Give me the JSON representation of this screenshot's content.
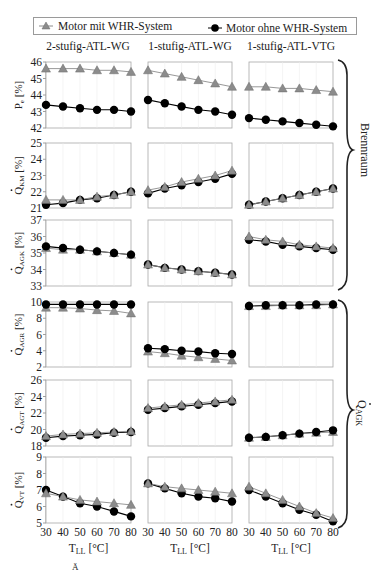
{
  "chart_data": {
    "type": "line",
    "legend": {
      "position": "top",
      "entries": [
        {
          "name": "Motor mit WHR-System",
          "marker": "triangle",
          "color": "#8c8c8c"
        },
        {
          "name": "Motor ohne WHR-System",
          "marker": "circle",
          "color": "#000000"
        }
      ]
    },
    "columns": [
      "2-stufig-ATL-WG",
      "1-stufig-ATL-WG",
      "1-stufig-ATL-VTG"
    ],
    "x": [
      30,
      40,
      50,
      60,
      70,
      80
    ],
    "xlabel": "T_LL [°C]",
    "xticks": [
      "30",
      "40",
      "50",
      "60",
      "70",
      "80"
    ],
    "grid": "vertical light",
    "groups": [
      {
        "label": "Brennraum",
        "rows": [
          0,
          1,
          2
        ]
      },
      {
        "label": "Q̇AGK",
        "rows": [
          3,
          4,
          5
        ]
      }
    ],
    "rows": [
      {
        "ylabel_main": "P",
        "ylabel_sub": "e",
        "ylabel_dot": false,
        "ylabel_unit": "[%]",
        "ylim": [
          42,
          46
        ],
        "yticks": [
          42,
          43,
          44,
          45,
          46
        ],
        "panels": [
          {
            "series": [
              {
                "name": "Motor mit WHR-System",
                "values": [
                  45.6,
                  45.6,
                  45.6,
                  45.5,
                  45.5,
                  45.4
                ]
              },
              {
                "name": "Motor ohne WHR-System",
                "values": [
                  43.4,
                  43.3,
                  43.2,
                  43.1,
                  43.1,
                  43.0
                ]
              }
            ]
          },
          {
            "series": [
              {
                "name": "Motor mit WHR-System",
                "values": [
                  45.5,
                  45.3,
                  45.1,
                  44.9,
                  44.7,
                  44.5
                ]
              },
              {
                "name": "Motor ohne WHR-System",
                "values": [
                  43.7,
                  43.5,
                  43.3,
                  43.1,
                  43.0,
                  42.8
                ]
              }
            ]
          },
          {
            "series": [
              {
                "name": "Motor mit WHR-System",
                "values": [
                  44.5,
                  44.5,
                  44.4,
                  44.4,
                  44.3,
                  44.2
                ]
              },
              {
                "name": "Motor ohne WHR-System",
                "values": [
                  42.6,
                  42.5,
                  42.4,
                  42.3,
                  42.2,
                  42.1
                ]
              }
            ]
          }
        ]
      },
      {
        "ylabel_main": "Q",
        "ylabel_sub": "KM",
        "ylabel_dot": true,
        "ylabel_unit": "[%]",
        "ylim": [
          21,
          25
        ],
        "yticks": [
          21,
          22,
          23,
          24,
          25
        ],
        "panels": [
          {
            "series": [
              {
                "name": "Motor mit WHR-System",
                "values": [
                  21.5,
                  21.5,
                  21.5,
                  21.7,
                  21.8,
                  22.0
                ]
              },
              {
                "name": "Motor ohne WHR-System",
                "values": [
                  21.2,
                  21.3,
                  21.5,
                  21.6,
                  21.8,
                  22.0
                ]
              }
            ]
          },
          {
            "series": [
              {
                "name": "Motor mit WHR-System",
                "values": [
                  22.1,
                  22.3,
                  22.6,
                  22.8,
                  23.0,
                  23.3
                ]
              },
              {
                "name": "Motor ohne WHR-System",
                "values": [
                  21.9,
                  22.2,
                  22.4,
                  22.6,
                  22.8,
                  23.1
                ]
              }
            ]
          },
          {
            "series": [
              {
                "name": "Motor mit WHR-System",
                "values": [
                  21.2,
                  21.4,
                  21.6,
                  21.8,
                  22.0,
                  22.2
                ]
              },
              {
                "name": "Motor ohne WHR-System",
                "values": [
                  21.2,
                  21.4,
                  21.6,
                  21.8,
                  22.0,
                  22.2
                ]
              }
            ]
          }
        ]
      },
      {
        "ylabel_main": "Q",
        "ylabel_sub": "AGK",
        "ylabel_dot": true,
        "ylabel_unit": "[%]",
        "ylim": [
          33,
          37
        ],
        "yticks": [
          33,
          34,
          35,
          36,
          37
        ],
        "panels": [
          {
            "series": [
              {
                "name": "Motor mit WHR-System",
                "values": [
                  35.3,
                  35.2,
                  35.2,
                  35.1,
                  35.0,
                  34.9
                ]
              },
              {
                "name": "Motor ohne WHR-System",
                "values": [
                  35.4,
                  35.3,
                  35.2,
                  35.1,
                  35.0,
                  34.9
                ]
              }
            ]
          },
          {
            "series": [
              {
                "name": "Motor mit WHR-System",
                "values": [
                  34.3,
                  34.1,
                  34.0,
                  33.9,
                  33.8,
                  33.7
                ]
              },
              {
                "name": "Motor ohne WHR-System",
                "values": [
                  34.3,
                  34.1,
                  34.0,
                  33.9,
                  33.8,
                  33.7
                ]
              }
            ]
          },
          {
            "series": [
              {
                "name": "Motor mit WHR-System",
                "values": [
                  36.0,
                  35.8,
                  35.7,
                  35.5,
                  35.4,
                  35.3
                ]
              },
              {
                "name": "Motor ohne WHR-System",
                "values": [
                  35.8,
                  35.7,
                  35.5,
                  35.4,
                  35.3,
                  35.2
                ]
              }
            ]
          }
        ]
      },
      {
        "ylabel_main": "Q",
        "ylabel_sub": "AGR",
        "ylabel_dot": true,
        "ylabel_unit": "[%]",
        "ylim": [
          2,
          10
        ],
        "yticks": [
          2,
          4,
          6,
          8,
          10
        ],
        "panels": [
          {
            "series": [
              {
                "name": "Motor mit WHR-System",
                "values": [
                  9.3,
                  9.3,
                  9.2,
                  9.0,
                  8.9,
                  8.6
                ]
              },
              {
                "name": "Motor ohne WHR-System",
                "values": [
                  9.7,
                  9.7,
                  9.7,
                  9.7,
                  9.7,
                  9.7
                ]
              }
            ]
          },
          {
            "series": [
              {
                "name": "Motor mit WHR-System",
                "values": [
                  3.9,
                  3.7,
                  3.4,
                  3.2,
                  3.0,
                  2.8
                ]
              },
              {
                "name": "Motor ohne WHR-System",
                "values": [
                  4.3,
                  4.2,
                  4.0,
                  3.9,
                  3.7,
                  3.6
                ]
              }
            ]
          },
          {
            "series": [
              {
                "name": "Motor mit WHR-System",
                "values": [
                  9.5,
                  9.5,
                  9.6,
                  9.6,
                  9.6,
                  9.7
                ]
              },
              {
                "name": "Motor ohne WHR-System",
                "values": [
                  9.5,
                  9.6,
                  9.6,
                  9.6,
                  9.7,
                  9.7
                ]
              }
            ]
          }
        ]
      },
      {
        "ylabel_main": "Q",
        "ylabel_sub": "AGT",
        "ylabel_dot": true,
        "ylabel_unit": "[%]",
        "ylim": [
          18,
          26
        ],
        "yticks": [
          18,
          20,
          22,
          24,
          26
        ],
        "panels": [
          {
            "series": [
              {
                "name": "Motor mit WHR-System",
                "values": [
                  19.2,
                  19.4,
                  19.5,
                  19.6,
                  19.7,
                  19.8
                ]
              },
              {
                "name": "Motor ohne WHR-System",
                "values": [
                  19.0,
                  19.2,
                  19.3,
                  19.4,
                  19.6,
                  19.7
                ]
              }
            ]
          },
          {
            "series": [
              {
                "name": "Motor mit WHR-System",
                "values": [
                  22.6,
                  22.8,
                  23.0,
                  23.2,
                  23.4,
                  23.6
                ]
              },
              {
                "name": "Motor ohne WHR-System",
                "values": [
                  22.4,
                  22.6,
                  22.8,
                  23.0,
                  23.2,
                  23.4
                ]
              }
            ]
          },
          {
            "series": [
              {
                "name": "Motor mit WHR-System",
                "values": [
                  19.0,
                  19.1,
                  19.3,
                  19.5,
                  19.6,
                  19.7
                ]
              },
              {
                "name": "Motor ohne WHR-System",
                "values": [
                  19.0,
                  19.1,
                  19.3,
                  19.5,
                  19.7,
                  19.9
                ]
              }
            ]
          }
        ]
      },
      {
        "ylabel_main": "Q",
        "ylabel_sub": "VT",
        "ylabel_dot": true,
        "ylabel_unit": "[%]",
        "ylim": [
          5,
          9
        ],
        "yticks": [
          5,
          6,
          7,
          8,
          9
        ],
        "panels": [
          {
            "series": [
              {
                "name": "Motor mit WHR-System",
                "values": [
                  6.8,
                  6.6,
                  6.4,
                  6.3,
                  6.2,
                  6.1
                ]
              },
              {
                "name": "Motor ohne WHR-System",
                "values": [
                  7.0,
                  6.6,
                  6.2,
                  6.0,
                  5.7,
                  5.4
                ]
              }
            ]
          },
          {
            "series": [
              {
                "name": "Motor mit WHR-System",
                "values": [
                  7.4,
                  7.2,
                  7.1,
                  7.0,
                  6.9,
                  6.8
                ]
              },
              {
                "name": "Motor ohne WHR-System",
                "values": [
                  7.4,
                  7.1,
                  6.8,
                  6.6,
                  6.5,
                  6.3
                ]
              }
            ]
          },
          {
            "series": [
              {
                "name": "Motor mit WHR-System",
                "values": [
                  7.2,
                  6.8,
                  6.4,
                  6.0,
                  5.6,
                  5.3
                ]
              },
              {
                "name": "Motor ohne WHR-System",
                "values": [
                  7.0,
                  6.6,
                  6.2,
                  5.8,
                  5.5,
                  5.1
                ]
              }
            ]
          }
        ]
      }
    ]
  },
  "legend": {
    "with_whr": "Motor mit WHR-System",
    "without_whr": "Motor ohne WHR-System"
  },
  "column_titles": [
    "2-stufig-ATL-WG",
    "1-stufig-ATL-WG",
    "1-stufig-ATL-VTG"
  ],
  "brace_labels": {
    "upper": "Brennraum",
    "lower_main": "Q",
    "lower_sub": "AGK"
  },
  "xaxis": {
    "label_main": "T",
    "label_sub": "LL",
    "label_unit": " [°C]"
  },
  "caption_fragment": "Ä"
}
